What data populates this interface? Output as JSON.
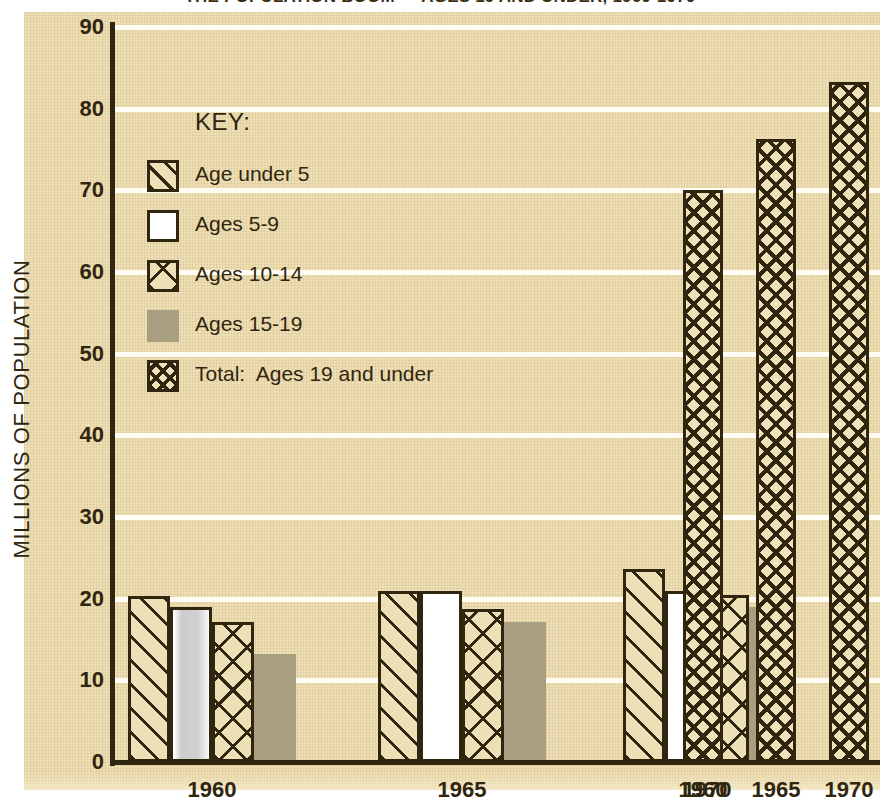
{
  "title": "THE POPULATION BOOM — AGES 19 AND UNDER, 1960-1970",
  "axes": {
    "y_title": "MILLIONS OF POPULATION",
    "y_ticks": [
      "90",
      "80",
      "70",
      "60",
      "50",
      "40",
      "30",
      "20",
      "10",
      "0"
    ],
    "x_ticks": [
      "1960",
      "1965",
      "1970",
      "1960",
      "1965",
      "1970"
    ]
  },
  "legend": {
    "title": "KEY:",
    "items": [
      {
        "label": "Age under 5",
        "pattern": "diagonal-hatch"
      },
      {
        "label": "Ages 5-9",
        "pattern": "solid-white"
      },
      {
        "label": "Ages 10-14",
        "pattern": "cross-hatch"
      },
      {
        "label": "Ages 15-19",
        "pattern": "solid-gray"
      },
      {
        "label": "Total:  Ages 19 and under",
        "pattern": "dense-cross-hatch"
      }
    ]
  },
  "colors": {
    "paper": "#efdfb4",
    "ink": "#30250f",
    "gridline": "#fffdf4",
    "gray_bar": "#a79f80",
    "white_bar": "#ffffff"
  },
  "chart_data": {
    "type": "bar",
    "title": "THE POPULATION BOOM — AGES 19 AND UNDER, 1960-1970",
    "xlabel": "",
    "ylabel": "MILLIONS OF POPULATION",
    "ylim": [
      0,
      90
    ],
    "yticks": [
      0,
      10,
      20,
      30,
      40,
      50,
      60,
      70,
      80,
      90
    ],
    "grid": true,
    "legend_position": "inside-upper-left",
    "categories": [
      "1960",
      "1965",
      "1970"
    ],
    "series": [
      {
        "name": "Age under 5",
        "pattern": "diagonal-hatch",
        "values": [
          20.3,
          21.0,
          23.6
        ]
      },
      {
        "name": "Ages 5-9",
        "pattern": "solid-white",
        "values": [
          19.0,
          21.0,
          21.0
        ]
      },
      {
        "name": "Ages 10-14",
        "pattern": "cross-hatch",
        "values": [
          17.1,
          18.7,
          20.5
        ]
      },
      {
        "name": "Ages 15-19",
        "pattern": "solid-gray",
        "values": [
          13.2,
          17.1,
          19.0
        ]
      }
    ],
    "totals": {
      "name": "Total: Ages 19 and under",
      "pattern": "dense-cross-hatch",
      "categories": [
        "1960",
        "1965",
        "1970"
      ],
      "values": [
        70.0,
        76.3,
        83.3
      ]
    }
  }
}
